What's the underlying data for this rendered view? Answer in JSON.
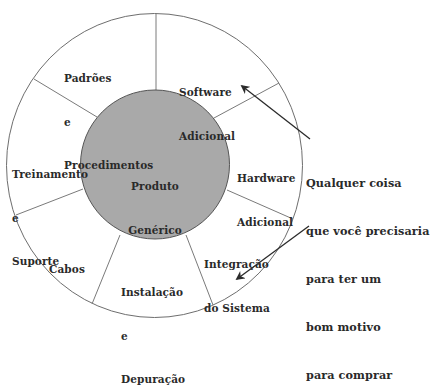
{
  "diagram": {
    "center": {
      "lines": [
        "Produto",
        "Genérico"
      ]
    },
    "segments": [
      {
        "id": "padroes",
        "lines": [
          "Padrões",
          "e",
          "Procedimentos"
        ]
      },
      {
        "id": "software",
        "lines": [
          "Software",
          "Adicional"
        ]
      },
      {
        "id": "hardware",
        "lines": [
          "Hardware",
          "Adicional"
        ]
      },
      {
        "id": "integracao",
        "lines": [
          "Integração",
          "do Sistema"
        ]
      },
      {
        "id": "instalacao",
        "lines": [
          "Instalação",
          "e",
          "Depuração"
        ]
      },
      {
        "id": "cabos",
        "lines": [
          "Cabos"
        ]
      },
      {
        "id": "treinamento",
        "lines": [
          "Treinamento",
          "e",
          "Suporte"
        ]
      }
    ],
    "annotation": {
      "lines": [
        "Qualquer coisa",
        "que você precisaria",
        "para ter um",
        "bom motivo",
        "para comprar"
      ],
      "arrows": [
        "to-software-adicional",
        "to-integracao-do-sistema"
      ]
    },
    "colors": {
      "inner_fill": "#a9a9a9",
      "inner_stroke": "#555555",
      "outer_stroke": "#6e6e6e",
      "divider_stroke": "#7a7a7a",
      "arrow": "#2b2b2b",
      "text": "#2a2a2a"
    }
  }
}
